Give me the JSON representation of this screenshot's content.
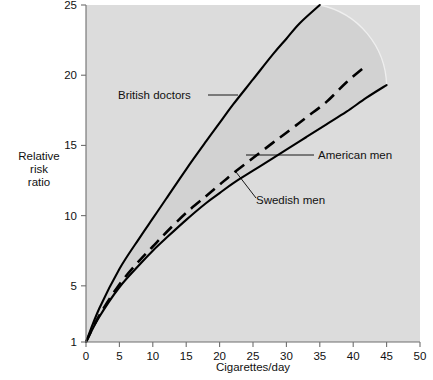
{
  "chart_data": {
    "type": "line",
    "title": "",
    "xlabel": "Cigarettes/day",
    "ylabel": "Relative\nrisk\nratio",
    "ylabel_lines": [
      "Relative",
      "risk",
      "ratio"
    ],
    "xlim": [
      0,
      50
    ],
    "ylim": [
      1,
      25
    ],
    "xticks": [
      0,
      5,
      10,
      15,
      20,
      25,
      30,
      35,
      40,
      45,
      50
    ],
    "xtick_labels": [
      "0",
      "5",
      "10",
      "15",
      "20",
      "25",
      "30",
      "35",
      "40",
      "45",
      "50"
    ],
    "yticks": [
      1,
      5,
      10,
      15,
      20,
      25
    ],
    "ytick_labels": [
      "1",
      "5",
      "10",
      "15",
      "20",
      "25"
    ],
    "grid": false,
    "legend_position": "inline-annotations",
    "plot_background_color": "#dcdcdc",
    "band_fill_color": "#d2d2d2",
    "curve_color": "#000000",
    "series": [
      {
        "name": "British doctors",
        "style": "solid",
        "x": [
          0,
          2,
          5,
          8,
          10,
          12,
          15,
          18,
          20,
          22,
          25,
          28,
          30,
          32,
          35
        ],
        "values": [
          1.0,
          3.4,
          6.2,
          8.4,
          9.8,
          11.2,
          13.3,
          15.3,
          16.6,
          17.9,
          19.7,
          21.5,
          22.6,
          23.7,
          25.0
        ]
      },
      {
        "name": "American men",
        "style": "dashed",
        "x": [
          0,
          2,
          5,
          8,
          10,
          12,
          15,
          18,
          20,
          22,
          25,
          28,
          30,
          33,
          36,
          39,
          42
        ],
        "values": [
          1.0,
          2.9,
          5.1,
          6.8,
          7.8,
          8.8,
          10.2,
          11.4,
          12.2,
          13.0,
          14.1,
          15.2,
          15.9,
          17.0,
          18.1,
          19.5,
          20.7
        ]
      },
      {
        "name": "Swedish men",
        "style": "solid",
        "x": [
          0,
          2,
          5,
          8,
          10,
          12,
          15,
          18,
          20,
          22,
          25,
          28,
          30,
          33,
          36,
          39,
          42,
          45
        ],
        "values": [
          1.0,
          2.8,
          4.9,
          6.5,
          7.5,
          8.4,
          9.7,
          10.9,
          11.6,
          12.3,
          13.2,
          14.1,
          14.7,
          15.6,
          16.5,
          17.4,
          18.4,
          19.3
        ]
      }
    ],
    "annotations": [
      {
        "label": "British doctors",
        "target_x": 22,
        "target_y": 17.9
      },
      {
        "label": "American men",
        "target_x": 22,
        "target_y": 14.5
      },
      {
        "label": "Swedish men",
        "target_x": 21,
        "target_y": 13.2
      }
    ]
  },
  "labels": {
    "british_doctors": "British doctors",
    "american_men": "American men",
    "swedish_men": "Swedish men",
    "x_axis_title": "Cigarettes/day",
    "y_axis_line1": "Relative",
    "y_axis_line2": "risk",
    "y_axis_line3": "ratio"
  }
}
